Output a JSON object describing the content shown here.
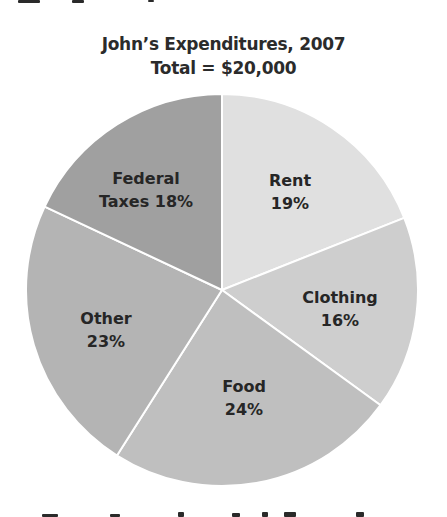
{
  "title": {
    "line1": "John’s Expenditures, 2007",
    "line2": "Total = $20,000"
  },
  "chart_data": {
    "type": "pie",
    "title": "John’s Expenditures, 2007",
    "subtitle": "Total = $20,000",
    "total": 20000,
    "unit": "percent",
    "start_angle_deg": 0,
    "direction": "clockwise",
    "categories": [
      "Rent",
      "Clothing",
      "Food",
      "Other",
      "Federal Taxes"
    ],
    "values": [
      19,
      16,
      24,
      23,
      18
    ],
    "slices": [
      {
        "label": "Rent",
        "value": 19,
        "color": "#e0e0e0",
        "text_lines": [
          "Rent",
          "19%"
        ],
        "label_pos": [
          290,
          180
        ]
      },
      {
        "label": "Clothing",
        "value": 16,
        "color": "#cecece",
        "text_lines": [
          "Clothing",
          "16%"
        ],
        "label_pos": [
          340,
          297
        ]
      },
      {
        "label": "Food",
        "value": 24,
        "color": "#bfbfbf",
        "text_lines": [
          "Food",
          "24%"
        ],
        "label_pos": [
          244,
          386
        ]
      },
      {
        "label": "Other",
        "value": 23,
        "color": "#b4b4b4",
        "text_lines": [
          "Other",
          "23%"
        ],
        "label_pos": [
          106,
          318
        ]
      },
      {
        "label": "Federal Taxes",
        "value": 18,
        "color": "#a0a0a0",
        "text_lines": [
          "Federal",
          "Taxes 18%"
        ],
        "label_pos": [
          146,
          178
        ]
      }
    ],
    "legend": "none",
    "separator_color": "#ffffff"
  }
}
